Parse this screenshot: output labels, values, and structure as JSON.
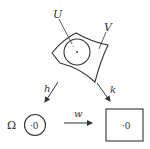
{
  "diagram": {
    "type": "commutative-diagram",
    "colors": {
      "stroke": "#333333",
      "background": "#ffffff"
    },
    "top": {
      "surface_label": "V",
      "disk_label": "U",
      "center_point": "·"
    },
    "arrows": {
      "left": {
        "label": "h",
        "direction": "down-left"
      },
      "right": {
        "label": "k",
        "direction": "down-right"
      },
      "bottom": {
        "label": "w",
        "direction": "right"
      }
    },
    "bottom_left": {
      "domain_label": "Ω",
      "disk_text": "·0"
    },
    "bottom_right": {
      "rect_text": "·0"
    }
  }
}
